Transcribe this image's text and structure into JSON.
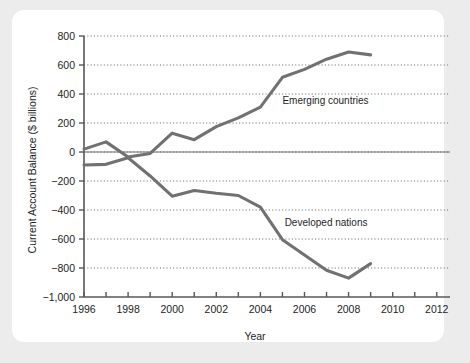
{
  "chart_data": {
    "type": "line",
    "title": "",
    "xlabel": "Year",
    "ylabel": "Current Account Balance ($ billions)",
    "xlim": [
      1996,
      2012.6
    ],
    "ylim": [
      -1000,
      800
    ],
    "y_ticks": [
      800,
      600,
      400,
      200,
      0,
      -200,
      -400,
      -600,
      -800,
      -1000
    ],
    "y_tick_labels": [
      "800",
      "600",
      "400",
      "200",
      "0",
      "−200",
      "−400",
      "−600",
      "−800",
      "−1,000"
    ],
    "x_ticks": [
      1996,
      1997,
      1998,
      1999,
      2000,
      2001,
      2002,
      2003,
      2004,
      2005,
      2006,
      2007,
      2008,
      2009,
      2010,
      2011,
      2012
    ],
    "x_tick_labels_shown": [
      "1996",
      "1998",
      "2000",
      "2002",
      "2004",
      "2006",
      "2008",
      "2010",
      "2012"
    ],
    "x_labeled_ticks": [
      1996,
      1998,
      2000,
      2002,
      2004,
      2006,
      2008,
      2010,
      2012
    ],
    "grid": "horizontal-dotted",
    "legend": "inline-annotations",
    "zero_line": true,
    "line_color": "#717174",
    "series": [
      {
        "name": "Emerging countries",
        "x": [
          1996,
          1997,
          1998,
          1999,
          2000,
          2001,
          2002,
          2003,
          2004,
          2005,
          2006,
          2007,
          2008,
          2009
        ],
        "values": [
          20,
          70,
          -35,
          -10,
          130,
          85,
          175,
          235,
          310,
          515,
          570,
          640,
          690,
          670
        ],
        "label_x": 2005.0,
        "label_y": 330
      },
      {
        "name": "Developed nations",
        "x": [
          1996,
          1997,
          1998,
          1999,
          2000,
          2001,
          2002,
          2003,
          2004,
          2005,
          2006,
          2007,
          2008,
          2009
        ],
        "values": [
          -90,
          -85,
          -40,
          -165,
          -305,
          -265,
          -285,
          -300,
          -380,
          -605,
          -710,
          -815,
          -870,
          -770
        ],
        "label_x": 2005.1,
        "label_y": -510
      }
    ]
  },
  "axes": {
    "y_axis_title": "Current Account Balance ($ billions)",
    "x_axis_title": "Year"
  },
  "annotations": {
    "emerging": "Emerging countries",
    "developed": "Developed nations"
  }
}
